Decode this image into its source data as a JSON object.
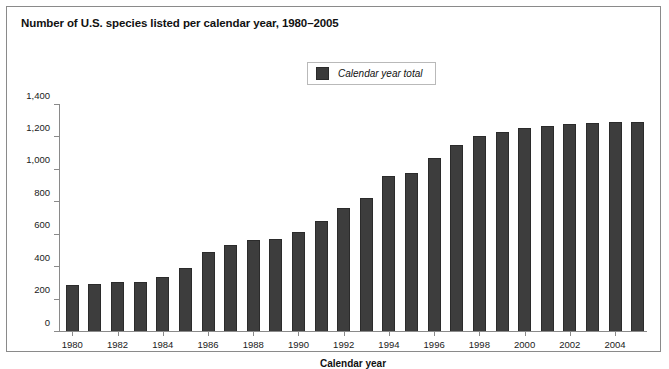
{
  "figure": {
    "title": "Number of U.S. species listed per calendar year, 1980–2005",
    "border_color": "#8a8a8a",
    "background": "#ffffff"
  },
  "legend": {
    "label": "Calendar year total",
    "swatch_color": "#3b3b3b",
    "position": "top-center"
  },
  "chart_data": {
    "type": "bar",
    "title": "Number of U.S. species listed per calendar year, 1980–2005",
    "xlabel": "Calendar year",
    "ylabel": "",
    "series_name": "Calendar year total",
    "bar_color": "#3d3d3d",
    "grid": false,
    "ylim": [
      0,
      1400
    ],
    "yticks": [
      0,
      200,
      400,
      600,
      800,
      1000,
      1200,
      1400
    ],
    "ytick_labels": [
      "0",
      "200",
      "400",
      "600",
      "800",
      "1,000",
      "1,200",
      "1,400"
    ],
    "xtick_labels": [
      "1980",
      "1982",
      "1984",
      "1986",
      "1988",
      "1990",
      "1992",
      "1994",
      "1996",
      "1998",
      "2000",
      "2002",
      "2004"
    ],
    "categories": [
      "1980",
      "1981",
      "1982",
      "1983",
      "1984",
      "1985",
      "1986",
      "1987",
      "1988",
      "1989",
      "1990",
      "1991",
      "1992",
      "1993",
      "1994",
      "1995",
      "1996",
      "1997",
      "1998",
      "1999",
      "2000",
      "2001",
      "2002",
      "2003",
      "2004",
      "2005"
    ],
    "values": [
      285,
      290,
      300,
      305,
      335,
      390,
      485,
      530,
      560,
      565,
      610,
      680,
      760,
      820,
      955,
      975,
      1065,
      1145,
      1205,
      1230,
      1255,
      1265,
      1275,
      1285,
      1290,
      1290
    ]
  }
}
